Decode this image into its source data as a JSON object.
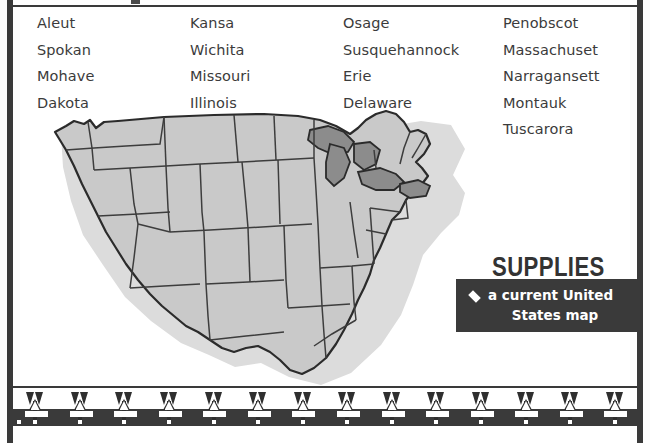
{
  "page": {
    "background_color": "#ffffff",
    "rule_color": "#3a3a3a"
  },
  "word_list": {
    "columns": [
      {
        "words": [
          "Aleut",
          "Spokan",
          "Mohave",
          "Dakota"
        ]
      },
      {
        "words": [
          "Kansa",
          "Wichita",
          "Missouri",
          "Illinois"
        ]
      },
      {
        "words": [
          "Osage",
          "Susquehannock",
          "Erie",
          "Delaware"
        ]
      },
      {
        "words": [
          "Penobscot",
          "Massachuset",
          "Narragansett",
          "Montauk",
          "Tuscarora"
        ]
      }
    ],
    "text_color": "#3b3b3b"
  },
  "map": {
    "name": "united-states-map",
    "land_color": "#c9c9c9",
    "lakes_color": "#8c8c8c",
    "outline_color": "#2b2b2b",
    "state_border_color": "#3d3d3d",
    "shadow_color": "#d9d9d9"
  },
  "supplies": {
    "heading": "SUPPLIES",
    "heading_color": "#333333",
    "box_color": "#3a3a3a",
    "bullet": "diamond-bullet",
    "item_line1": "a current United",
    "item_line2": "States map",
    "item_text_color": "#ffffff"
  },
  "bottom_border": {
    "name": "arrow-decorative-border",
    "motif": "arrow-icon",
    "arrow_count": 14,
    "color": "#2f2f2f",
    "band_color": "#3a3a3a",
    "dash_color": "#ffffff"
  }
}
